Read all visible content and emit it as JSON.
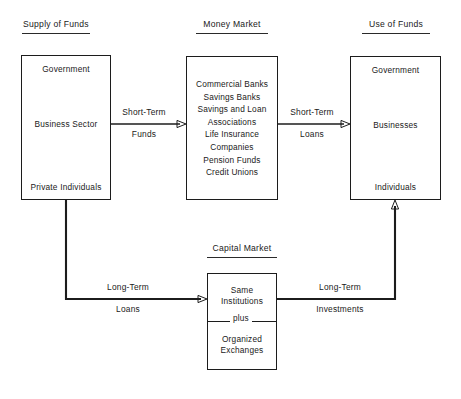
{
  "diagram": {
    "colors": {
      "ink": "#1c1c1c",
      "background": "#ffffff"
    },
    "columns": [
      {
        "id": "supply",
        "header": "Supply of Funds",
        "entries": [
          "Government",
          "Business Sector",
          "Private Individuals"
        ]
      },
      {
        "id": "money_market",
        "header": "Money Market",
        "entries": [
          "Commercial Banks",
          "Savings Banks",
          "Savings and Loan Associations",
          "Life Insurance Companies",
          "Pension Funds",
          "Credit Unions"
        ]
      },
      {
        "id": "use",
        "header": "Use of Funds",
        "entries": [
          "Government",
          "Businesses",
          "Individuals"
        ]
      }
    ],
    "capital_market": {
      "header": "Capital Market",
      "top_entry": "Same Institutions",
      "connector": "plus",
      "bottom_entry": "Organized Exchanges"
    },
    "flows": [
      {
        "id": "supply-to-money",
        "line1": "Short-Term",
        "line2": "Funds"
      },
      {
        "id": "money-to-use",
        "line1": "Short-Term",
        "line2": "Loans"
      },
      {
        "id": "supply-to-capital",
        "line1": "Long-Term",
        "line2": "Loans"
      },
      {
        "id": "capital-to-use",
        "line1": "Long-Term",
        "line2": "Investments"
      }
    ]
  }
}
